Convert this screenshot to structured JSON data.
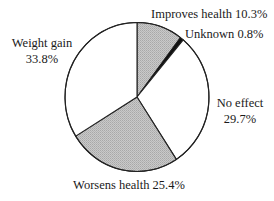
{
  "chart_data": {
    "type": "pie",
    "title": "",
    "start": "12 o'clock",
    "direction": "clockwise",
    "unit": "%",
    "slices": [
      {
        "name": "Improves health",
        "value": 10.3,
        "fill": "gray-stipple",
        "label_lines": [
          "Improves health 10.3%"
        ]
      },
      {
        "name": "Unknown",
        "value": 0.8,
        "fill": "black",
        "label_lines": [
          "Unknown 0.8%"
        ]
      },
      {
        "name": "No effect",
        "value": 29.7,
        "fill": "white",
        "label_lines": [
          "No effect",
          "29.7%"
        ]
      },
      {
        "name": "Worsens health",
        "value": 25.4,
        "fill": "gray-stipple",
        "label_lines": [
          "Worsens health 25.4%"
        ]
      },
      {
        "name": "Weight gain",
        "value": 33.8,
        "fill": "white",
        "label_lines": [
          "Weight gain",
          "33.8%"
        ]
      }
    ],
    "colors": {
      "gray-stipple": "#bcbcbc",
      "black": "#111111",
      "white": "#ffffff",
      "outline": "#222222"
    },
    "legend": "none (direct labels)"
  }
}
